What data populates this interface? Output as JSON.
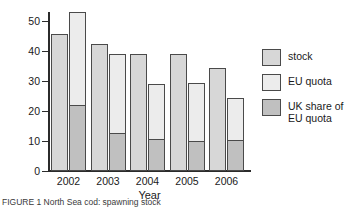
{
  "chart_data": {
    "type": "bar",
    "title": "",
    "xlabel": "Year",
    "ylabel": "Thousand tonnes",
    "categories": [
      "2002",
      "2003",
      "2004",
      "2005",
      "2006"
    ],
    "ylim": [
      0,
      50
    ],
    "yticks": [
      0,
      10,
      20,
      30,
      40,
      50
    ],
    "ytick_labels": [
      "0",
      "10",
      "20",
      "30",
      "40",
      "50"
    ],
    "grid": false,
    "legend_position": "right",
    "series": [
      {
        "name": "stock",
        "values": [
          43.5,
          40.3,
          37.4,
          37.4,
          32.7
        ]
      },
      {
        "name": "EU quota",
        "values": [
          50.5,
          37.4,
          27.7,
          28.0,
          23.3
        ]
      },
      {
        "name": "UK share of EU quota",
        "values": [
          20.6,
          11.8,
          9.8,
          9.1,
          9.5
        ]
      }
    ]
  },
  "axes": {
    "y_title": "Thousand tonnes",
    "x_title": "Year"
  },
  "legend": {
    "items": [
      {
        "key": "stock",
        "label": "stock",
        "color": "#d7d7d7"
      },
      {
        "key": "eu-quota",
        "label": "EU quota",
        "color": "#ececec"
      },
      {
        "key": "uk-share",
        "label": "UK share of\nEU quota",
        "color": "#c0c0c0"
      }
    ]
  },
  "caption": {
    "text": "FIGURE 1  North Sea cod: spawning stock"
  }
}
